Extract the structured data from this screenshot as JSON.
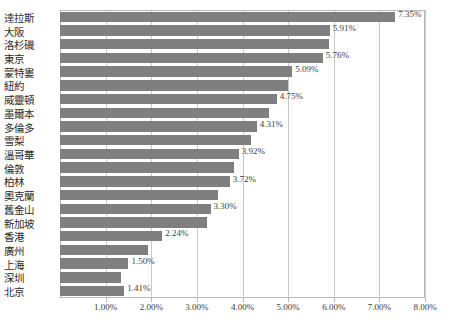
{
  "chart_data": {
    "type": "bar",
    "orientation": "horizontal",
    "title": "",
    "subtitle": "",
    "xlabel": "",
    "ylabel": "",
    "xlim": [
      0,
      8
    ],
    "xtick_labels": [
      "1.00%",
      "2.00%",
      "3.00%",
      "4.00%",
      "5.00%",
      "6.00%",
      "7.00%",
      "8.00%"
    ],
    "xticks": [
      1,
      2,
      3,
      4,
      5,
      6,
      7,
      8
    ],
    "grid": true,
    "legend": "none",
    "bar_color": "#7f7f7f",
    "categories": [
      "達拉斯",
      "大阪",
      "洛杉磯",
      "東京",
      "蒙特婁",
      "紐約",
      "威靈頓",
      "墨爾本",
      "多倫多",
      "雪梨",
      "溫哥華",
      "倫敦",
      "柏林",
      "奧克蘭",
      "舊金山",
      "新加坡",
      "香港",
      "廣州",
      "上海",
      "深圳",
      "北京"
    ],
    "values": [
      7.35,
      5.91,
      5.9,
      5.76,
      5.09,
      5.0,
      4.75,
      4.57,
      4.31,
      4.18,
      3.92,
      3.82,
      3.72,
      3.46,
      3.3,
      3.22,
      2.24,
      1.92,
      1.5,
      1.34,
      1.41
    ],
    "data_labels": [
      "7.35%",
      "5.91%",
      "",
      "5.76%",
      "5.09%",
      "",
      "4.75%",
      "",
      "4.31%",
      "",
      "3.92%",
      "",
      "3.72%",
      "",
      "3.30%",
      "",
      "2.24%",
      "",
      "1.50%",
      "",
      "1.41%"
    ]
  }
}
